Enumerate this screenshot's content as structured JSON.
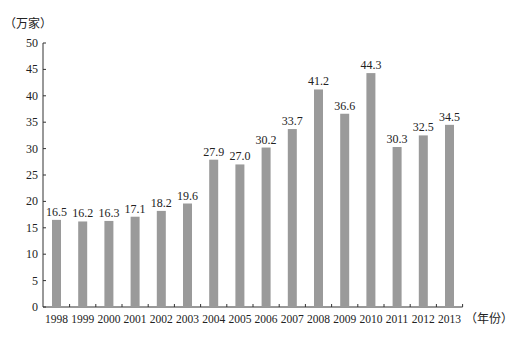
{
  "chart_data": {
    "type": "bar",
    "title": "",
    "xlabel": "（年份）",
    "ylabel": "（万家）",
    "ylim": [
      0,
      50
    ],
    "yticks": [
      0,
      5,
      10,
      15,
      20,
      25,
      30,
      35,
      40,
      45,
      50
    ],
    "grid": false,
    "legend": null,
    "categories": [
      "1998",
      "1999",
      "2000",
      "2001",
      "2002",
      "2003",
      "2004",
      "2005",
      "2006",
      "2007",
      "2008",
      "2009",
      "2010",
      "2011",
      "2012",
      "2013"
    ],
    "values": [
      16.5,
      16.2,
      16.3,
      17.1,
      18.2,
      19.6,
      27.9,
      27.0,
      30.2,
      33.7,
      41.2,
      36.6,
      44.3,
      30.3,
      32.5,
      34.5
    ],
    "data_labels": [
      "16.5",
      "16.2",
      "16.3",
      "17.1",
      "18.2",
      "19.6",
      "27.9",
      "27.0",
      "30.2",
      "33.7",
      "41.2",
      "36.6",
      "44.3",
      "30.3",
      "32.5",
      "34.5"
    ],
    "bar_color": "#9a9a9a"
  },
  "labels": {
    "y_unit": "（万家）",
    "x_unit": "（年份）"
  }
}
